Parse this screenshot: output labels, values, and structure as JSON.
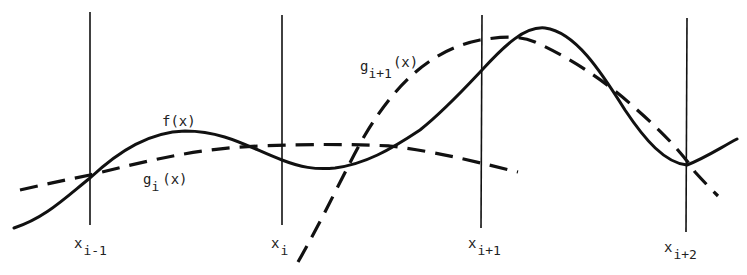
{
  "figure": {
    "colors": {
      "ink": "#111111",
      "background": "#ffffff"
    },
    "grid_lines": [
      {
        "id": "x_i_minus_1",
        "base": "x",
        "sub": "i-1",
        "x": 90
      },
      {
        "id": "x_i",
        "base": "x",
        "sub": "i",
        "x": 282
      },
      {
        "id": "x_i_plus_1",
        "base": "x",
        "sub": "i+1",
        "x": 482
      },
      {
        "id": "x_i_plus_2",
        "base": "x",
        "sub": "i+2",
        "x": 687
      }
    ],
    "curves": {
      "f": {
        "label": "f(x)",
        "style": "solid"
      },
      "g_i": {
        "base": "g",
        "sub": "i",
        "arg": "(x)",
        "style": "dashed"
      },
      "g_i_plus_1": {
        "base": "g",
        "sub": "i+1",
        "arg": "(x)",
        "style": "dashed"
      }
    }
  }
}
